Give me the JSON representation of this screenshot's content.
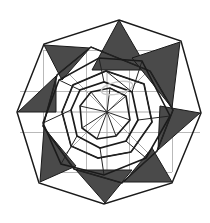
{
  "figure": {
    "canvas": {
      "width": 210,
      "height": 223,
      "background": "#ffffff"
    },
    "center": {
      "x": 107,
      "y": 112
    },
    "colors": {
      "background": "#ffffff",
      "outline": "#1a1a1a",
      "fill_dark": "#4a4a4a",
      "grid_gray": "#b9b9b9",
      "ray_gray": "#a8a8a8",
      "halo_gray": "#c9c9c9"
    },
    "grid": {
      "type": "3x3",
      "vertical_x": [
        43,
        86,
        129,
        172
      ],
      "horizontal_y": [
        50,
        91,
        132,
        172
      ],
      "stroke": "#b9b9b9",
      "visible": true
    },
    "rays": {
      "count": 8,
      "length": 62,
      "angles_deg": [
        0,
        45,
        90,
        135,
        180,
        225,
        270,
        315
      ],
      "stroke": "#a8a8a8"
    },
    "rings": [
      {
        "name": "ring-1-inner",
        "radius": 30,
        "rotation_deg": 8,
        "stroke_width": 1.6,
        "sides": 8
      },
      {
        "name": "ring-2",
        "radius": 46,
        "rotation_deg": 26,
        "stroke_width": 1.7,
        "sides": 8
      },
      {
        "name": "ring-3",
        "radius": 63,
        "rotation_deg": 44,
        "stroke_width": 1.6,
        "sides": 8
      },
      {
        "name": "ring-4-outer",
        "radius": 80,
        "rotation_deg": 62,
        "stroke_width": 1.5,
        "sides": 8
      }
    ],
    "star_points": [
      {
        "name": "point-top",
        "angle_deg": 90,
        "tip": {
          "x": 119,
          "y": 20
        },
        "filled": true
      },
      {
        "name": "point-upper-right",
        "angle_deg": 45,
        "tip": {
          "x": 180,
          "y": 42
        },
        "filled": true
      },
      {
        "name": "point-right",
        "angle_deg": 0,
        "tip": {
          "x": 200,
          "y": 113
        },
        "filled": true
      },
      {
        "name": "point-lower-right",
        "angle_deg": 315,
        "tip": {
          "x": 172,
          "y": 182
        },
        "filled": true
      },
      {
        "name": "point-bottom",
        "angle_deg": 270,
        "tip": {
          "x": 105,
          "y": 203
        },
        "filled": true
      },
      {
        "name": "point-lower-left",
        "angle_deg": 225,
        "tip": {
          "x": 40,
          "y": 182
        },
        "filled": true
      },
      {
        "name": "point-left",
        "angle_deg": 180,
        "tip": {
          "x": 18,
          "y": 112
        },
        "filled": true
      },
      {
        "name": "point-upper-left",
        "angle_deg": 135,
        "tip": {
          "x": 44,
          "y": 45
        },
        "filled": true
      }
    ],
    "dark_triangles": [
      {
        "name": "dark-triangle-top",
        "points": "119,20 148,70 92,70"
      },
      {
        "name": "dark-triangle-upper-right",
        "points": "180,42 172,108 132,58"
      },
      {
        "name": "dark-triangle-right",
        "points": "200,113 158,150 160,106"
      },
      {
        "name": "dark-triangle-lower-right",
        "points": "172,182 124,182 152,148"
      },
      {
        "name": "dark-triangle-bottom",
        "points": "105,203 76,170 132,170"
      },
      {
        "name": "dark-triangle-lower-left",
        "points": "40,182 44,128 76,166"
      },
      {
        "name": "dark-triangle-left",
        "points": "18,112 56,76 56,112"
      },
      {
        "name": "dark-triangle-upper-left",
        "points": "44,45 90,48 62,80"
      }
    ],
    "halo": {
      "name": "inner-ellipse-highlight",
      "cx": 117,
      "cy": 88,
      "rx": 16,
      "ry": 6,
      "rotation_deg": -12
    }
  }
}
